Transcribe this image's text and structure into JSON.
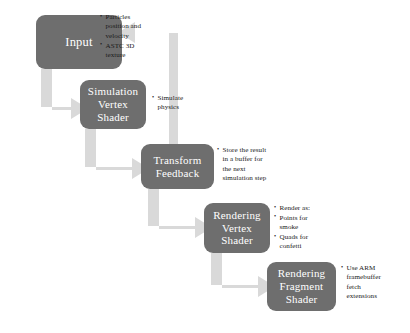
{
  "diagram": {
    "colors": {
      "node_fill": "#6e6e6e",
      "node_text": "#ffffff",
      "arrow_fill": "#d9d9d9",
      "note_text": "#1a1a1a",
      "background": "#ffffff"
    },
    "nodes": [
      {
        "id": "input",
        "lines": [
          "Input"
        ],
        "notes": [
          "Particles position and velocity",
          "ASTC 3D texture"
        ]
      },
      {
        "id": "simulation",
        "lines": [
          "Simulation",
          "Vertex",
          "Shader"
        ],
        "notes": [
          "Simulate physics"
        ]
      },
      {
        "id": "transform",
        "lines": [
          "Transform",
          "Feedback"
        ],
        "notes": [
          "Store the result in a buffer for the next simulation step"
        ]
      },
      {
        "id": "rendering_vertex",
        "lines": [
          "Rendering",
          "Vertex",
          "Shader"
        ],
        "notes": [
          "Render as:",
          "Points for smoke",
          "Quads for confetti"
        ]
      },
      {
        "id": "rendering_fragment",
        "lines": [
          "Rendering",
          "Fragment",
          "Shader"
        ],
        "notes": [
          "Use ARM framebuffer fetch extensions"
        ]
      }
    ],
    "arrows": [
      {
        "id": "input-to-simulation",
        "from": "input",
        "to": "simulation",
        "shape": "elbow-down-right"
      },
      {
        "id": "simulation-to-transform",
        "from": "simulation",
        "to": "transform",
        "shape": "elbow-down-right"
      },
      {
        "id": "transform-to-rendering-vertex",
        "from": "transform",
        "to": "rendering_vertex",
        "shape": "elbow-down-right"
      },
      {
        "id": "rendering-vertex-to-rendering-fragment",
        "from": "rendering_vertex",
        "to": "rendering_fragment",
        "shape": "elbow-down-right"
      },
      {
        "id": "transform-feedback-loop",
        "from": "transform",
        "to": "input",
        "shape": "elbow-up-left"
      }
    ]
  }
}
